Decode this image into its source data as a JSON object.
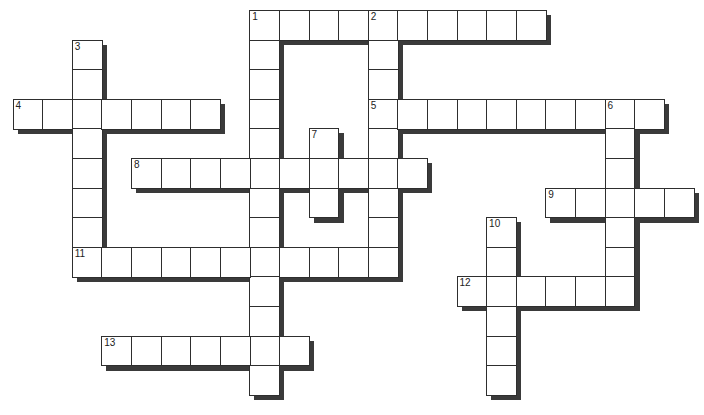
{
  "puzzle": {
    "grid_origin": {
      "x": 12.5,
      "y": 10
    },
    "cell_size": 29.6,
    "shadow_offset": 5,
    "colors": {
      "cell_bg": "#ffffff",
      "border": "#2e2e2e",
      "shadow": "#3a3a3a"
    },
    "words": [
      {
        "number": "1",
        "direction": "across",
        "row": 0,
        "col": 8,
        "length": 10
      },
      {
        "number": "1",
        "direction": "down",
        "row": 0,
        "col": 8,
        "length": 13
      },
      {
        "number": "2",
        "direction": "down",
        "row": 0,
        "col": 12,
        "length": 9
      },
      {
        "number": "3",
        "direction": "down",
        "row": 1,
        "col": 2,
        "length": 8
      },
      {
        "number": "4",
        "direction": "across",
        "row": 3,
        "col": 0,
        "length": 7
      },
      {
        "number": "5",
        "direction": "across",
        "row": 3,
        "col": 12,
        "length": 10
      },
      {
        "number": "6",
        "direction": "down",
        "row": 3,
        "col": 20,
        "length": 7
      },
      {
        "number": "7",
        "direction": "down",
        "row": 4,
        "col": 10,
        "length": 3
      },
      {
        "number": "8",
        "direction": "across",
        "row": 5,
        "col": 4,
        "length": 10
      },
      {
        "number": "9",
        "direction": "across",
        "row": 6,
        "col": 18,
        "length": 5
      },
      {
        "number": "10",
        "direction": "down",
        "row": 7,
        "col": 16,
        "length": 6
      },
      {
        "number": "11",
        "direction": "across",
        "row": 8,
        "col": 2,
        "length": 11
      },
      {
        "number": "12",
        "direction": "across",
        "row": 9,
        "col": 15,
        "length": 6
      },
      {
        "number": "13",
        "direction": "across",
        "row": 11,
        "col": 3,
        "length": 7
      }
    ],
    "numbered_cells": [
      {
        "number": "1",
        "row": 0,
        "col": 8
      },
      {
        "number": "2",
        "row": 0,
        "col": 12
      },
      {
        "number": "3",
        "row": 1,
        "col": 2
      },
      {
        "number": "4",
        "row": 3,
        "col": 0
      },
      {
        "number": "5",
        "row": 3,
        "col": 12
      },
      {
        "number": "6",
        "row": 3,
        "col": 20
      },
      {
        "number": "7",
        "row": 4,
        "col": 10
      },
      {
        "number": "8",
        "row": 5,
        "col": 4
      },
      {
        "number": "9",
        "row": 6,
        "col": 18
      },
      {
        "number": "10",
        "row": 7,
        "col": 16
      },
      {
        "number": "11",
        "row": 8,
        "col": 2
      },
      {
        "number": "12",
        "row": 9,
        "col": 15
      },
      {
        "number": "13",
        "row": 11,
        "col": 3
      }
    ]
  }
}
